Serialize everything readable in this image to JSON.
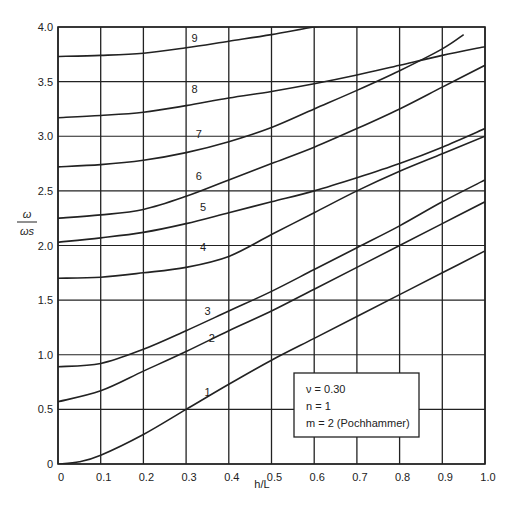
{
  "chart_data": {
    "type": "line",
    "title": "",
    "xlabel": "h/L",
    "ylabel": "ω/ω_s",
    "ylabel_num": "ω",
    "ylabel_den": "ωs",
    "xlim": [
      0,
      1.0
    ],
    "ylim": [
      0,
      4.0
    ],
    "grid": true,
    "x_ticks": [
      "0",
      "0.1",
      "0.2",
      "0.3",
      "0.4",
      "0.5",
      "0.6",
      "0.7",
      "0.8",
      "0.9",
      "1.0"
    ],
    "y_ticks": [
      "0",
      "0.5",
      "1.0",
      "1.5",
      "2.0",
      "2.5",
      "3.0",
      "3.5",
      "4.0"
    ],
    "legend": {
      "position": "lower right",
      "lines": [
        "ν = 0.30",
        "n = 1",
        "m = 2 (Pochhammer)"
      ]
    },
    "series": [
      {
        "name": "1",
        "x": [
          0,
          0.05,
          0.1,
          0.2,
          0.3,
          0.4,
          0.5,
          0.6,
          0.7,
          0.8,
          0.9,
          1.0
        ],
        "values": [
          0,
          0.02,
          0.08,
          0.27,
          0.5,
          0.73,
          0.95,
          1.15,
          1.35,
          1.55,
          1.75,
          1.95
        ]
      },
      {
        "name": "2",
        "x": [
          0,
          0.1,
          0.2,
          0.3,
          0.4,
          0.5,
          0.6,
          0.7,
          0.8,
          0.9,
          1.0
        ],
        "values": [
          0.57,
          0.67,
          0.85,
          1.03,
          1.22,
          1.4,
          1.6,
          1.8,
          2.0,
          2.2,
          2.4
        ]
      },
      {
        "name": "3",
        "x": [
          0,
          0.1,
          0.2,
          0.3,
          0.4,
          0.5,
          0.6,
          0.7,
          0.8,
          0.9,
          1.0
        ],
        "values": [
          0.89,
          0.92,
          1.05,
          1.22,
          1.4,
          1.58,
          1.78,
          1.98,
          2.18,
          2.4,
          2.6
        ]
      },
      {
        "name": "4",
        "x": [
          0,
          0.1,
          0.2,
          0.3,
          0.4,
          0.5,
          0.6,
          0.7,
          0.8,
          0.9,
          1.0
        ],
        "values": [
          1.7,
          1.71,
          1.75,
          1.8,
          1.9,
          2.1,
          2.3,
          2.5,
          2.68,
          2.84,
          3.0
        ]
      },
      {
        "name": "5",
        "x": [
          0,
          0.1,
          0.2,
          0.3,
          0.4,
          0.5,
          0.6,
          0.7,
          0.8,
          0.9,
          1.0
        ],
        "values": [
          2.03,
          2.07,
          2.12,
          2.2,
          2.3,
          2.4,
          2.5,
          2.62,
          2.75,
          2.9,
          3.07
        ]
      },
      {
        "name": "6",
        "x": [
          0,
          0.1,
          0.2,
          0.3,
          0.4,
          0.5,
          0.6,
          0.7,
          0.8,
          0.9,
          1.0
        ],
        "values": [
          2.25,
          2.28,
          2.33,
          2.45,
          2.6,
          2.75,
          2.9,
          3.07,
          3.25,
          3.45,
          3.65
        ]
      },
      {
        "name": "7",
        "x": [
          0,
          0.1,
          0.2,
          0.3,
          0.4,
          0.5,
          0.6,
          0.7,
          0.8,
          0.9,
          0.95
        ],
        "values": [
          2.72,
          2.74,
          2.78,
          2.85,
          2.95,
          3.08,
          3.25,
          3.42,
          3.6,
          3.8,
          3.93
        ]
      },
      {
        "name": "8",
        "x": [
          0,
          0.1,
          0.2,
          0.3,
          0.4,
          0.5,
          0.6,
          0.7,
          0.8,
          0.9,
          1.0
        ],
        "values": [
          3.17,
          3.19,
          3.22,
          3.28,
          3.35,
          3.41,
          3.48,
          3.56,
          3.65,
          3.74,
          3.82
        ]
      },
      {
        "name": "9",
        "x": [
          0,
          0.1,
          0.2,
          0.3,
          0.4,
          0.5,
          0.6,
          0.65
        ],
        "values": [
          3.73,
          3.74,
          3.76,
          3.81,
          3.87,
          3.93,
          4.0,
          4.02
        ]
      }
    ]
  },
  "layout": {
    "plot": {
      "left": 58,
      "top": 27,
      "right": 485,
      "bottom": 464
    },
    "line_color": "#222222",
    "background": "#ffffff",
    "label_positions": [
      {
        "name": "1",
        "x": 0.35,
        "y": 0.62
      },
      {
        "name": "2",
        "x": 0.36,
        "y": 1.12
      },
      {
        "name": "3",
        "x": 0.35,
        "y": 1.36
      },
      {
        "name": "4",
        "x": 0.34,
        "y": 1.95
      },
      {
        "name": "5",
        "x": 0.34,
        "y": 2.32
      },
      {
        "name": "6",
        "x": 0.33,
        "y": 2.6
      },
      {
        "name": "7",
        "x": 0.33,
        "y": 2.98
      },
      {
        "name": "8",
        "x": 0.32,
        "y": 3.4
      },
      {
        "name": "9",
        "x": 0.32,
        "y": 3.86
      }
    ]
  }
}
